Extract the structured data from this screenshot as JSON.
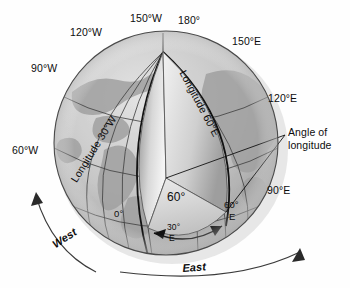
{
  "figure": {
    "type": "geographic-diagram",
    "background_color": "#fefefe",
    "ink_color": "#0d0d0d"
  },
  "globe": {
    "name": "earth-globe",
    "center_x": 166,
    "center_y": 143,
    "radius": 112,
    "pole_x": 163,
    "pole_y": 52,
    "ocean_color": "#c9c9c9",
    "land_color": "#a8a8a8",
    "cut_face_light": "#f0f0f0",
    "cut_face_dark": "#9a9a9a",
    "outline_color": "#4a4a4a"
  },
  "meridian_labels": [
    {
      "id": "150w",
      "text": "150°W"
    },
    {
      "id": "120w",
      "text": "120°W"
    },
    {
      "id": "90w",
      "text": "90°W"
    },
    {
      "id": "60w",
      "text": "60°W"
    },
    {
      "id": "180",
      "text": "180°"
    },
    {
      "id": "150e",
      "text": "150°E"
    },
    {
      "id": "120e",
      "text": "120°E"
    },
    {
      "id": "90e",
      "text": "90°E"
    }
  ],
  "wedge_labels": {
    "longitude_30w": "Longitude 30°W",
    "longitude_60e": "Longitude 60°E",
    "angle_value": "60°",
    "zero_meridian": "0°",
    "thirty_east_deg": "30°",
    "thirty_east_letter": "E",
    "sixty_east_deg": "60°",
    "sixty_east_letter": "E"
  },
  "callout": {
    "line1": "Angle of",
    "line2": "longitude"
  },
  "rotation_labels": {
    "west": "West",
    "east": "East"
  }
}
